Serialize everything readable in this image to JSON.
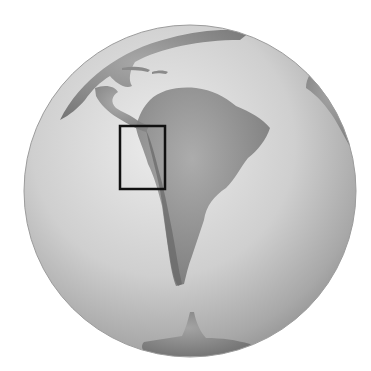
{
  "map": {
    "type": "orthographic-globe",
    "style": "grayscale shaded relief",
    "globe": {
      "cx": 190,
      "cy": 191,
      "r": 166
    },
    "colors": {
      "background": "#ffffff",
      "ocean_light": "#e4e4e4",
      "ocean_dark": "#9a9a9a",
      "land": "#8e8e8e",
      "land_dark": "#6e6e6e",
      "highlight_box": "#111111"
    },
    "visible_landmasses": [
      "North America (Gulf of Mexico / Florida)",
      "Central America",
      "Caribbean islands",
      "South America",
      "Africa (western edge)",
      "Antarctic Peninsula / Antarctica"
    ],
    "highlight_box": {
      "x": 120,
      "y": 126,
      "width": 45,
      "height": 63,
      "region": "Northwestern South America (Peru / Andes)"
    }
  }
}
